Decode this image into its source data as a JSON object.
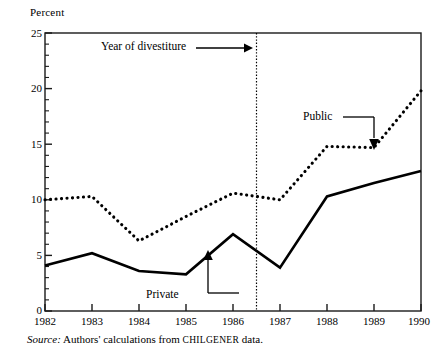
{
  "chart_data": {
    "type": "line",
    "title": "",
    "xlabel": "",
    "ylabel": "Percent",
    "xlim": [
      1982,
      1990
    ],
    "ylim": [
      0,
      25
    ],
    "grid": false,
    "legend_position": "inline-annotations",
    "x": [
      1982,
      1983,
      1984,
      1985,
      1986,
      1987,
      1988,
      1989,
      1990
    ],
    "ytick_values": [
      0,
      5,
      10,
      15,
      20,
      25
    ],
    "ytick_labels": [
      "0",
      "5",
      "10",
      "15",
      "20",
      "25"
    ],
    "xtick_labels": [
      "1982",
      "1983",
      "1984",
      "1985",
      "1986",
      "1987",
      "1988",
      "1989",
      "1990"
    ],
    "minor_ytick_values": [
      1,
      2,
      3,
      4,
      6,
      7,
      8,
      9,
      11,
      12,
      13,
      14,
      16,
      17,
      18,
      19,
      21,
      22,
      23,
      24
    ],
    "series": [
      {
        "name": "Public",
        "style": "dotted",
        "values": [
          10.0,
          10.3,
          6.3,
          8.5,
          10.6,
          10.0,
          14.8,
          14.7,
          19.8
        ]
      },
      {
        "name": "Private",
        "style": "solid",
        "values": [
          4.1,
          5.2,
          3.6,
          3.3,
          6.9,
          3.9,
          10.3,
          11.5,
          12.6
        ]
      }
    ],
    "annotations": [
      {
        "name": "divestiture-marker",
        "label": "Year of divestiture",
        "x_value": 1986.5,
        "marker": "vertical-dotted-line",
        "arrow": "right"
      },
      {
        "name": "private-series-label",
        "label": "Private",
        "points_to_series": "Private",
        "points_to_x": 1986,
        "arrow": "up"
      },
      {
        "name": "public-series-label",
        "label": "Public",
        "points_to_series": "Public",
        "points_to_x": 1989,
        "arrow": "down"
      }
    ]
  },
  "source": {
    "prefix": "Source:",
    "text_before": " Authors' calculations from ",
    "smallcaps": "CHILGENER",
    "text_after": " data."
  },
  "colors": {
    "line": "#000000",
    "background": "#ffffff",
    "axis": "#1a1a1a"
  }
}
